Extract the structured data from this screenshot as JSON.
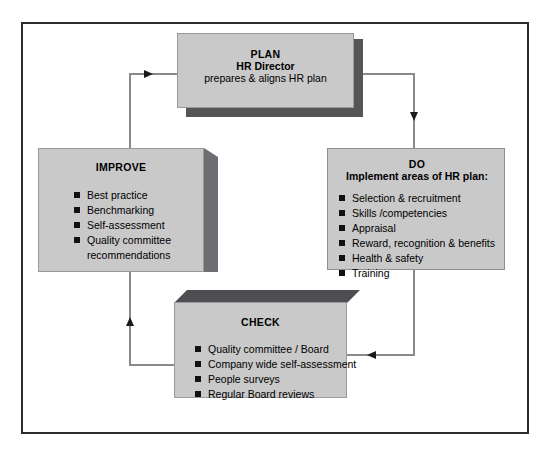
{
  "diagram": {
    "type": "pdca-cycle",
    "title": "",
    "colors": {
      "box_fill": "#c9c9c9",
      "box_shadow": "#555558",
      "box_top_bevel": "#4e4e52",
      "box_side_bevel": "#6e6e72",
      "border": "#2b2b2b",
      "connector": "#8a8a8a",
      "arrowhead": "#1a1a1a",
      "bullet": "#111111",
      "text": "#000000",
      "background": "#ffffff"
    },
    "nodes": [
      {
        "id": "plan",
        "title": "PLAN",
        "subtitle": "HR Director",
        "description": "prepares & aligns HR plan",
        "bullets": []
      },
      {
        "id": "do",
        "title": "DO",
        "subtitle": "Implement areas of HR plan:",
        "description": "",
        "bullets": [
          "Selection & recruitment",
          "Skills /competencies",
          "Appraisal",
          "Reward, recognition & benefits",
          "Health & safety",
          "Training"
        ]
      },
      {
        "id": "check",
        "title": "CHECK",
        "subtitle": "",
        "description": "",
        "bullets": [
          "Quality committee / Board",
          "Company wide self-assessment",
          "People surveys",
          "Regular Board reviews"
        ]
      },
      {
        "id": "improve",
        "title": "IMPROVE",
        "subtitle": "",
        "description": "",
        "bullets": [
          "Best practice",
          "Benchmarking",
          "Self-assessment",
          "Quality committee"
        ],
        "bullet_continuation": "recommendations"
      }
    ],
    "connectors": [
      {
        "id": "improve-to-plan",
        "from": "improve",
        "to": "plan",
        "direction": "right",
        "label": ""
      },
      {
        "id": "plan-to-do",
        "from": "plan",
        "to": "do",
        "direction": "down",
        "label": ""
      },
      {
        "id": "do-to-check",
        "from": "do",
        "to": "check",
        "direction": "left",
        "label": ""
      },
      {
        "id": "check-to-improve",
        "from": "check",
        "to": "improve",
        "direction": "up",
        "label": ""
      }
    ]
  }
}
